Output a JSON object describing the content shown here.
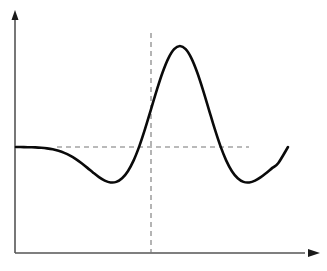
{
  "figure": {
    "title": "",
    "background_color": "#ffffff",
    "width": 327,
    "height": 271
  },
  "axes": {
    "x_axis": {
      "name": "horizontal-axis",
      "label": "",
      "arrow": true,
      "color": "#555555",
      "origin_px": [
        15,
        253
      ],
      "end_px": [
        320,
        253
      ]
    },
    "y_axis": {
      "name": "vertical-axis",
      "label": "",
      "arrow": true,
      "color": "#555555",
      "origin_px": [
        15,
        253
      ],
      "end_px": [
        15,
        12
      ]
    }
  },
  "guides": {
    "baseline": {
      "name": "horizontal-dashed-baseline",
      "style": "dashed",
      "color": "#777777",
      "y_value": 0,
      "x_start_px": 57,
      "x_end_px": 249,
      "y_px": 147
    },
    "center": {
      "name": "vertical-dashed-center",
      "style": "dashed",
      "color": "#777777",
      "x_value": 0,
      "x_px": 151,
      "y_start_px": 33,
      "y_end_px": 253
    }
  },
  "chart_data": {
    "type": "line",
    "title": "",
    "xlabel": "",
    "ylabel": "",
    "grid": false,
    "legend": null,
    "xlim": [
      -4,
      4
    ],
    "ylim": [
      -0.55,
      1.05
    ],
    "series": [
      {
        "name": "mexican-hat-wavelet",
        "color": "#0a0a0a",
        "line_width": 2.6,
        "annotations": {
          "peak": {
            "x": 0,
            "y": 1.0,
            "px": [
              151,
              46
            ]
          },
          "left_trough": {
            "x": -1.73,
            "y": -0.446,
            "px": [
              101,
              189
            ]
          },
          "right_trough": {
            "x": 1.73,
            "y": -0.446,
            "px": [
              201,
              189
            ]
          },
          "left_zero_crossing": {
            "x": -1.0,
            "y": 0,
            "px": [
              126,
              147
            ]
          },
          "right_zero_crossing": {
            "x": 1.0,
            "y": 0,
            "px": [
              176,
              147
            ]
          }
        },
        "x": [
          -4.4,
          -4.2,
          -4.0,
          -3.8,
          -3.6,
          -3.4,
          -3.2,
          -3.0,
          -2.8,
          -2.6,
          -2.4,
          -2.2,
          -2.0,
          -1.8,
          -1.6,
          -1.4,
          -1.2,
          -1.0,
          -0.8,
          -0.6,
          -0.4,
          -0.2,
          0.0,
          0.2,
          0.4,
          0.6,
          0.8,
          1.0,
          1.2,
          1.4,
          1.6,
          1.8,
          2.0,
          2.2,
          2.4,
          2.6,
          2.8,
          3.0,
          3.2,
          3.4,
          3.6,
          3.8,
          4.0,
          4.2,
          4.4,
          4.8,
          5.2,
          5.6
        ],
        "y": [
          -0.001,
          -0.003,
          -0.005,
          -0.01,
          -0.018,
          -0.03,
          -0.049,
          -0.075,
          -0.11,
          -0.155,
          -0.209,
          -0.268,
          -0.33,
          -0.387,
          -0.432,
          -0.455,
          -0.448,
          -0.402,
          -0.311,
          -0.172,
          0.014,
          0.238,
          0.484,
          0.731,
          0.957,
          1.139,
          1.257,
          1.297,
          1.257,
          1.139,
          0.957,
          0.731,
          0.484,
          0.238,
          0.014,
          -0.172,
          -0.311,
          -0.402,
          -0.448,
          -0.455,
          -0.432,
          -0.387,
          -0.33,
          -0.268,
          -0.209,
          -0.11,
          -0.049,
          -0.018
        ]
      }
    ]
  }
}
